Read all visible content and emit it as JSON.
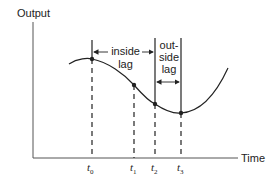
{
  "diagram": {
    "y_axis_label": "Output",
    "x_axis_label": "Time",
    "inside_lag": {
      "line1": "inside",
      "line2": "lag"
    },
    "outside_lag": {
      "line1": "out-",
      "line2": "side",
      "line3": "lag"
    },
    "time_marks": [
      {
        "base": "t",
        "sub": "0"
      },
      {
        "base": "t",
        "sub": "1"
      },
      {
        "base": "t",
        "sub": "2"
      },
      {
        "base": "t",
        "sub": "3"
      }
    ],
    "colors": {
      "ink": "#222222",
      "background": "#ffffff"
    }
  }
}
